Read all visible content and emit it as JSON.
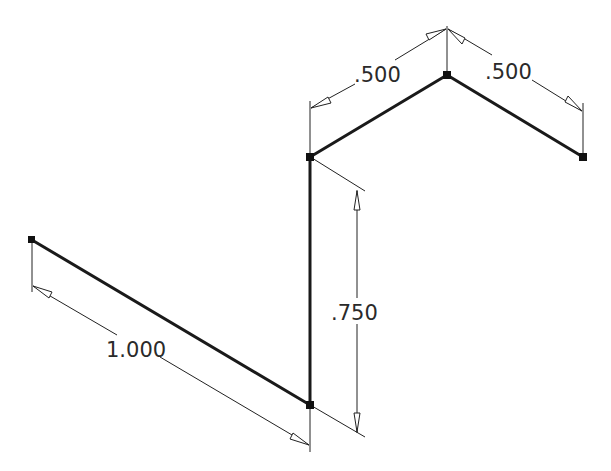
{
  "diagram": {
    "type": "isometric-sketch-dimensioned",
    "colors": {
      "background": "#ffffff",
      "geometry": "#1a1a1a",
      "dimension": "#222222",
      "text": "#2a2a2a"
    },
    "points": {
      "p1": [
        32,
        240
      ],
      "p2": [
        310,
        405
      ],
      "p3": [
        310,
        157
      ],
      "p4": [
        447,
        75
      ],
      "p5": [
        583,
        157
      ]
    },
    "segments": [
      {
        "name": "segment-diagonal-lower",
        "from": "p1",
        "to": "p2"
      },
      {
        "name": "segment-vertical",
        "from": "p2",
        "to": "p3"
      },
      {
        "name": "segment-upper-left",
        "from": "p3",
        "to": "p4"
      },
      {
        "name": "segment-upper-right",
        "from": "p4",
        "to": "p5"
      }
    ],
    "dimensions": [
      {
        "name": "dimension-1000",
        "label": "1.000"
      },
      {
        "name": "dimension-0750",
        "label": ".750"
      },
      {
        "name": "dimension-0500-left",
        "label": ".500"
      },
      {
        "name": "dimension-0500-right",
        "label": ".500"
      }
    ]
  }
}
